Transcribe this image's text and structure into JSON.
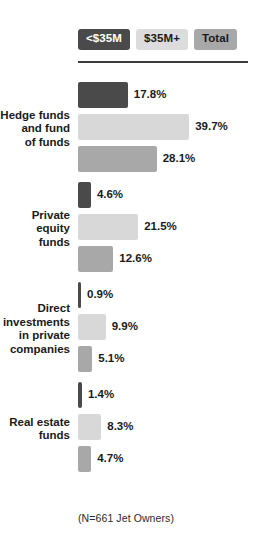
{
  "chart_data": {
    "type": "bar",
    "orientation": "horizontal",
    "title": "",
    "xlabel": "",
    "ylabel": "",
    "grid": false,
    "legend_position": "top",
    "xlim": [
      0,
      45
    ],
    "value_suffix": "%",
    "categories": [
      "Hedge funds and fund of funds",
      "Private equity funds",
      "Direct investments in private companies",
      "Real estate funds"
    ],
    "category_lines": [
      [
        "Hedge funds",
        "and fund",
        "of funds"
      ],
      [
        "Private",
        "equity",
        "funds"
      ],
      [
        "Direct",
        "investments",
        "in private",
        "companies"
      ],
      [
        "Real estate",
        "funds"
      ]
    ],
    "series": [
      {
        "name": "<$35M",
        "color": "#4a4a4a",
        "text_color": "#ffffff",
        "values": [
          17.8,
          4.6,
          0.9,
          1.4
        ],
        "labels": [
          "17.8%",
          "4.6%",
          "0.9%",
          "1.4%"
        ]
      },
      {
        "name": "$35M+",
        "color": "#d8d8d8",
        "text_color": "#1a1a1a",
        "values": [
          39.7,
          21.5,
          9.9,
          8.3
        ],
        "labels": [
          "39.7%",
          "21.5%",
          "9.9%",
          "8.3%"
        ]
      },
      {
        "name": "Total",
        "color": "#a8a8a8",
        "text_color": "#1a1a1a",
        "values": [
          28.1,
          12.6,
          5.1,
          4.7
        ],
        "labels": [
          "28.1%",
          "12.6%",
          "5.1%",
          "4.7%"
        ]
      }
    ],
    "footnote": "(N=661 Jet Owners)"
  }
}
